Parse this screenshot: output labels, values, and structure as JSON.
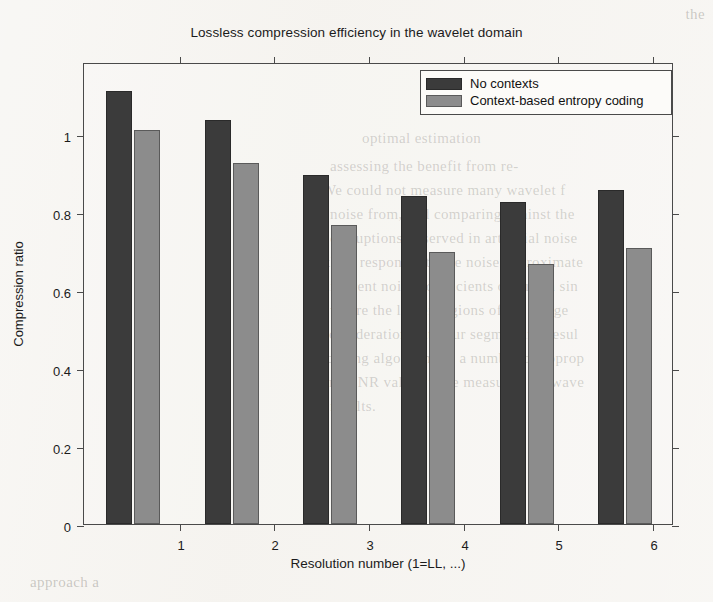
{
  "chart_data": {
    "type": "bar",
    "title": "Lossless compression efficiency in the wavelet domain",
    "xlabel": "Resolution number (1=LL, ...)",
    "ylabel": "Compression ratio",
    "categories": [
      "1",
      "2",
      "3",
      "4",
      "5",
      "6"
    ],
    "series": [
      {
        "name": "No contexts",
        "color": "#3b3b3b",
        "values": [
          1.05,
          0.98,
          0.845,
          0.795,
          0.78,
          0.81
        ]
      },
      {
        "name": "Context-based entropy coding",
        "color": "#8c8c8c",
        "values": [
          0.955,
          0.875,
          0.725,
          0.66,
          0.63,
          0.67
        ]
      }
    ],
    "ylim": [
      0,
      1.12
    ],
    "yticks": [
      0,
      0.2,
      0.4,
      0.6,
      0.8,
      1
    ],
    "ytick_labels": [
      "0",
      "0.2",
      "0.4",
      "0.6",
      "0.8",
      "1"
    ],
    "grid": false,
    "legend_position": "top-right"
  },
  "background_text": {
    "right_column": [
      "the",
      "optimal estimation",
      "assessing the benefit from re-",
      "We could not measure many wavelet f",
      "noise from, and comparing against the",
      "corruptions observed in artificial noise",
      "their responses to the noise approximate",
      "different noise coefficients of such a sin",
      "where the larger regions of the image",
      "consideration with our segmenting resul",
      "coding algorithm on a number of approp",
      "and SNR values were measured for wave",
      "results."
    ],
    "bottom_note": "approach a"
  }
}
